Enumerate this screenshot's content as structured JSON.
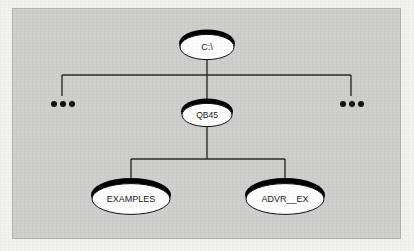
{
  "figure": {
    "kind": "directory-tree-diagram",
    "background_color": "#f2f2f0",
    "panel_color": "#cfcfcd",
    "panel_border_color": "#b4b4b2",
    "line_color": "#2b2b2b",
    "node_fill_color": "#ffffff",
    "node_shadow_color": "#000000",
    "label_color": "#1a1a1a"
  },
  "nodes": [
    {
      "id": "root",
      "label": "C:\\",
      "cx": 207,
      "cy": 46,
      "rx": 28,
      "ry": 14,
      "font_size": 9
    },
    {
      "id": "qb45",
      "label": "QB45",
      "cx": 207,
      "cy": 114,
      "rx": 26,
      "ry": 13,
      "font_size": 8.5
    },
    {
      "id": "examples",
      "label": "EXAMPLES",
      "cx": 131,
      "cy": 198,
      "rx": 40,
      "ry": 17,
      "font_size": 9
    },
    {
      "id": "advr",
      "label": "ADVR__EX",
      "cx": 285,
      "cy": 198,
      "rx": 40,
      "ry": 17,
      "font_size": 9
    }
  ],
  "ellipses_markers": [
    {
      "id": "left-ellipsis",
      "label": "...",
      "cx": 62,
      "cy": 104
    },
    {
      "id": "right-ellipsis",
      "label": "...",
      "cx": 351,
      "cy": 104
    }
  ],
  "connectors": {
    "upper_bus_y": 75,
    "upper_bus_x1": 62,
    "upper_bus_x2": 351,
    "lower_bus_y": 159,
    "lower_bus_x1": 131,
    "lower_bus_x2": 285
  }
}
